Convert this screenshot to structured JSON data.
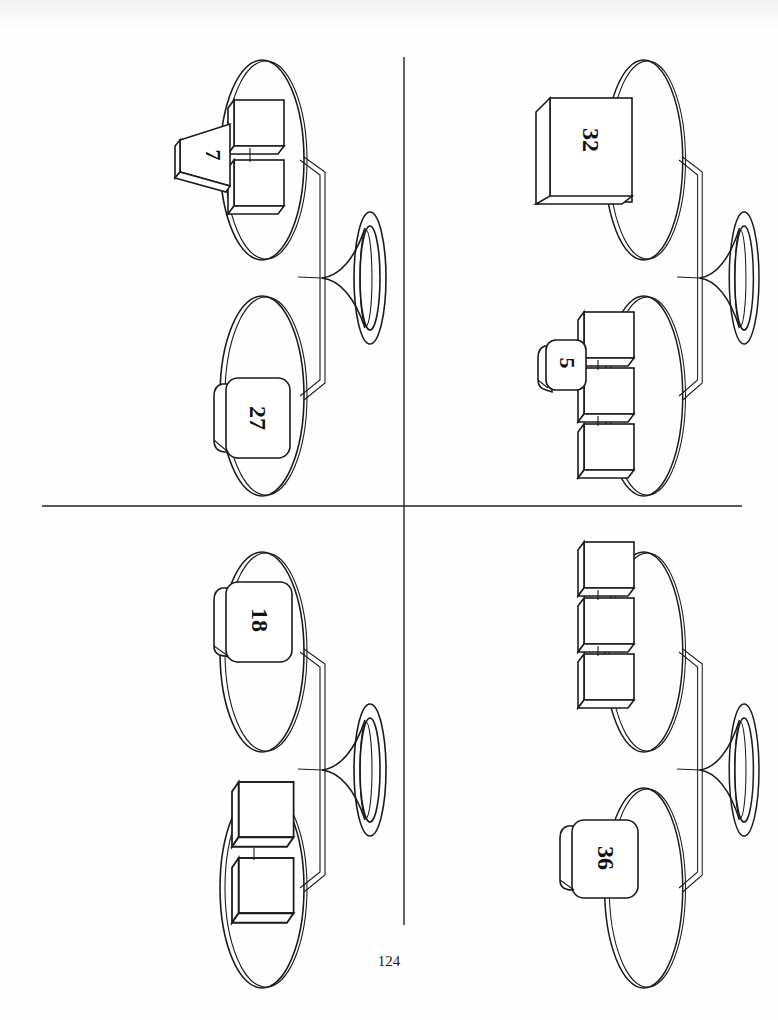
{
  "page": {
    "page_number": "124",
    "orientation": "rotated 90 degrees (landscape content on portrait page)"
  },
  "scales": [
    {
      "id": "top-left",
      "upper_pan": {
        "items": [
          {
            "type": "cube"
          },
          {
            "type": "cube"
          },
          {
            "type": "trapezoid-weight",
            "label": "7"
          }
        ]
      },
      "lower_pan": {
        "items": [
          {
            "type": "rounded-weight",
            "label": "27"
          }
        ]
      }
    },
    {
      "id": "top-right",
      "upper_pan": {
        "items": [
          {
            "type": "large-cube",
            "label": "32"
          }
        ]
      },
      "lower_pan": {
        "items": [
          {
            "type": "cube"
          },
          {
            "type": "cube"
          },
          {
            "type": "cube"
          },
          {
            "type": "rounded-weight",
            "label": "5"
          }
        ]
      }
    },
    {
      "id": "bottom-left",
      "upper_pan": {
        "items": [
          {
            "type": "rounded-weight",
            "label": "18"
          }
        ]
      },
      "lower_pan": {
        "items": [
          {
            "type": "cube"
          },
          {
            "type": "cube"
          }
        ]
      }
    },
    {
      "id": "bottom-right",
      "upper_pan": {
        "items": [
          {
            "type": "cube"
          },
          {
            "type": "cube"
          },
          {
            "type": "cube"
          }
        ]
      },
      "lower_pan": {
        "items": [
          {
            "type": "rounded-weight",
            "label": "36"
          }
        ]
      }
    }
  ],
  "labels": {
    "s1_weight_a": "7",
    "s1_weight_b": "27",
    "s2_weight_a": "32",
    "s2_weight_b": "5",
    "s3_weight_a": "18",
    "s4_weight_a": "36"
  },
  "colors": {
    "ink": "#1a1a1a",
    "paper": "#fefefe"
  }
}
